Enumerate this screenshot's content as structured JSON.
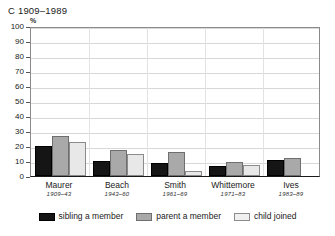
{
  "title": "C 1909–1989",
  "axis_unit": "%",
  "chart_data": {
    "type": "bar",
    "title": "C 1909–1989",
    "subtitle": "",
    "xlabel": "",
    "ylabel": "%",
    "ylim": [
      0,
      100
    ],
    "yticks": [
      0,
      10,
      20,
      30,
      40,
      50,
      60,
      70,
      80,
      90,
      100
    ],
    "ytick_labels": [
      "0",
      "10",
      "20",
      "30",
      "40",
      "50",
      "60",
      "70",
      "80",
      "90",
      "100"
    ],
    "grid": true,
    "legend_position": "bottom",
    "categories": [
      "Maurer",
      "Beach",
      "Smith",
      "Whittemore",
      "Ives"
    ],
    "category_sublabels": [
      "1909–43",
      "1943–60",
      "1961–69",
      "1971–83",
      "1983–89"
    ],
    "series": [
      {
        "name": "sibling a member",
        "color": "#151515",
        "values": [
          20,
          10,
          9,
          6.5,
          11
        ]
      },
      {
        "name": "parent a member",
        "color": "#a9a9a9",
        "values": [
          27,
          17.5,
          16,
          9.5,
          12
        ]
      },
      {
        "name": "child joined",
        "color": "#e8e8e8",
        "values": [
          22.5,
          14.5,
          3.5,
          7.5,
          0
        ]
      }
    ]
  },
  "legend": {
    "items": [
      {
        "label": "sibling a member"
      },
      {
        "label": "parent a member"
      },
      {
        "label": "child joined"
      }
    ]
  }
}
